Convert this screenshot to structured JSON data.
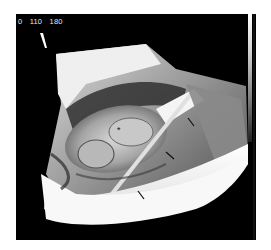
{
  "image": {
    "description": "3D ultrasound volume rendering",
    "scale_labels": [
      "0",
      "110",
      "180"
    ],
    "markers": {
      "asterisk": "*",
      "arrows_count": 3
    },
    "colors": {
      "background": "#000000",
      "frame": "#ffffff",
      "label": "#e8e8e8"
    }
  }
}
